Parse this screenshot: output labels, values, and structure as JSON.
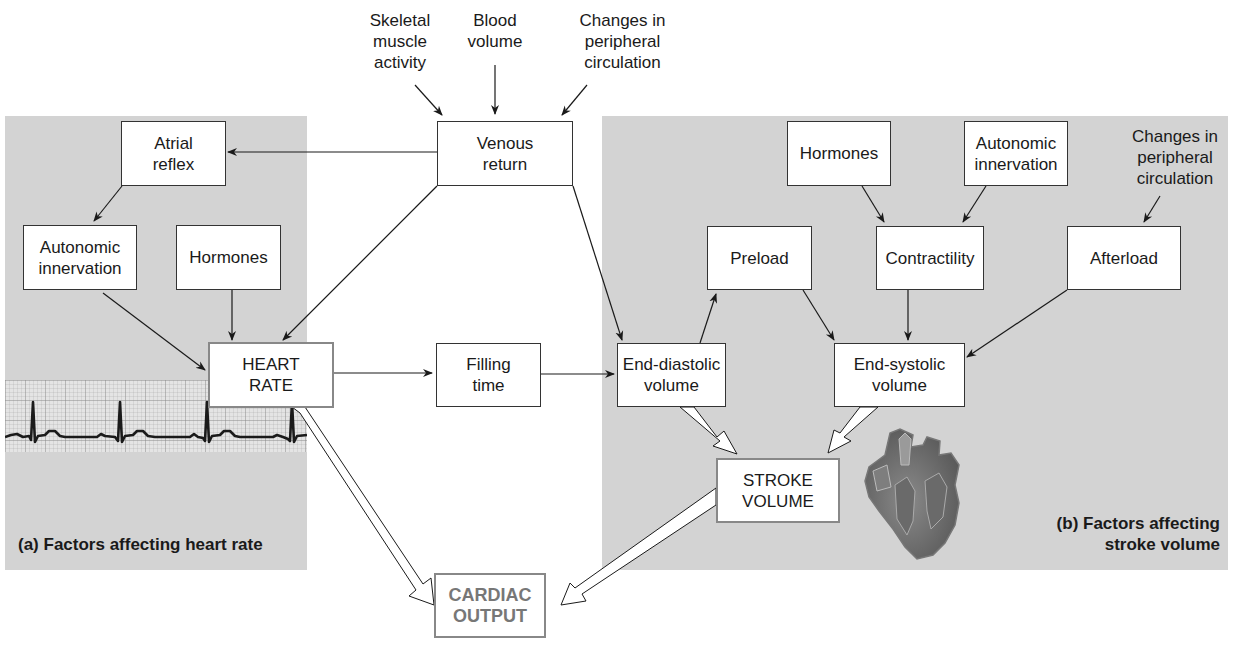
{
  "panels": {
    "a": {
      "caption": "(a) Factors affecting heart rate"
    },
    "b": {
      "caption": "(b) Factors affecting\nstroke volume"
    }
  },
  "top_inputs": {
    "skeletal": "Skeletal\nmuscle\nactivity",
    "blood_volume": "Blood\nvolume",
    "peripheral": "Changes in\nperipheral\ncirculation"
  },
  "right_input": {
    "peripheral": "Changes in\nperipheral\ncirculation"
  },
  "nodes": {
    "venous_return": "Venous\nreturn",
    "atrial_reflex": "Atrial\nreflex",
    "autonomic_left": "Autonomic\ninnervation",
    "hormones_left": "Hormones",
    "heart_rate": "HEART\nRATE",
    "filling_time": "Filling\ntime",
    "end_diastolic": "End-diastolic\nvolume",
    "preload": "Preload",
    "hormones_right": "Hormones",
    "autonomic_right": "Autonomic\ninnervation",
    "contractility": "Contractility",
    "afterload": "Afterload",
    "end_systolic": "End-systolic\nvolume",
    "stroke_volume": "STROKE\nVOLUME",
    "cardiac_output": "CARDIAC\nOUTPUT"
  },
  "colors": {
    "panel_bg": "#d3d3d3",
    "line": "#1a1a1a",
    "output_text": "#777777",
    "ecg_grid": "#9a9a9a"
  },
  "illustrations": {
    "ecg_strip": "electrocardiogram-trace",
    "heart": "heart-cross-section"
  }
}
